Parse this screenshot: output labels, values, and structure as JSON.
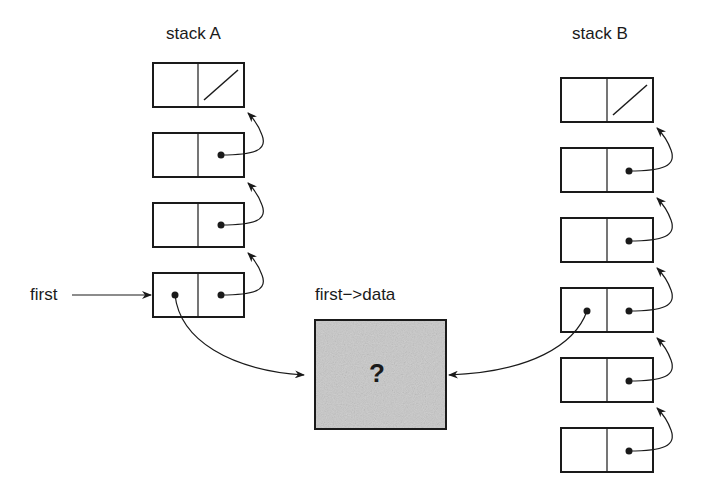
{
  "diagram": {
    "stack_a": {
      "title": "stack A",
      "node_count": 4,
      "top_has_null": true
    },
    "stack_b": {
      "title": "stack B",
      "node_count": 6,
      "top_has_null": true
    },
    "pointer_label": "first",
    "data_label": "first−>data",
    "data_box_symbol": "?",
    "colors": {
      "line": "#1a1a1a",
      "data_fill": "#c8c8c8",
      "background": "#ffffff"
    }
  }
}
